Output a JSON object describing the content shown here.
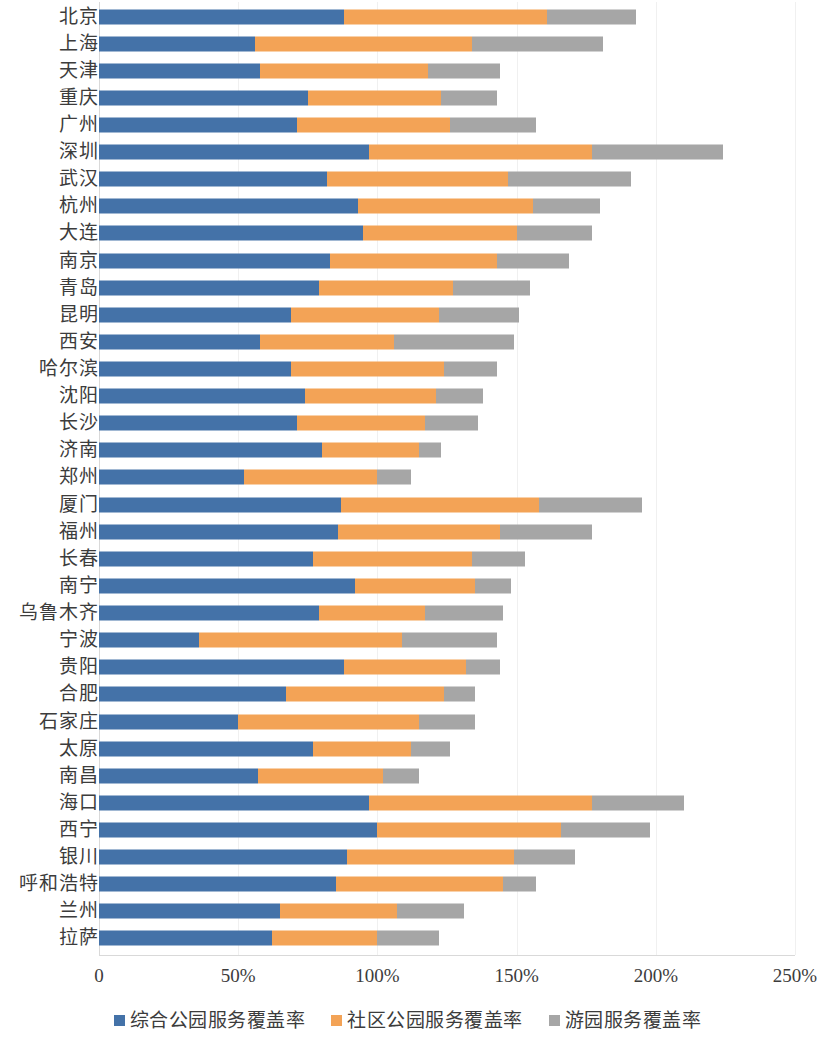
{
  "chart_data": {
    "type": "bar",
    "orientation": "horizontal",
    "stacked": true,
    "title": "",
    "subtitle": "",
    "xlabel": "",
    "ylabel": "",
    "xlim": [
      0,
      250
    ],
    "xtick_labels": [
      "0",
      "50%",
      "100%",
      "150%",
      "200%",
      "250%"
    ],
    "xtick_values": [
      0,
      50,
      100,
      150,
      200,
      250
    ],
    "grid": true,
    "legend_position": "bottom",
    "unit": "%",
    "colors": {
      "series_1": "#4472a8",
      "series_2": "#f3a356",
      "series_3": "#a6a6a6",
      "gridline": "#f0f0f0",
      "axis": "#d9d9d9",
      "text": "#3c3c3c"
    },
    "categories": [
      "北京",
      "上海",
      "天津",
      "重庆",
      "广州",
      "深圳",
      "武汉",
      "杭州",
      "大连",
      "南京",
      "青岛",
      "昆明",
      "西安",
      "哈尔滨",
      "沈阳",
      "长沙",
      "济南",
      "郑州",
      "厦门",
      "福州",
      "长春",
      "南宁",
      "乌鲁木齐",
      "宁波",
      "贵阳",
      "合肥",
      "石家庄",
      "太原",
      "南昌",
      "海口",
      "西宁",
      "银川",
      "呼和浩特",
      "兰州",
      "拉萨"
    ],
    "series": [
      {
        "name": "综合公园服务覆盖率",
        "color": "#4472a8",
        "values": [
          88,
          56,
          58,
          75,
          71,
          97,
          82,
          93,
          95,
          83,
          79,
          69,
          58,
          69,
          74,
          71,
          80,
          52,
          87,
          86,
          77,
          92,
          79,
          36,
          88,
          67,
          50,
          77,
          57,
          97,
          100,
          89,
          85,
          65,
          62
        ]
      },
      {
        "name": "社区公园服务覆盖率",
        "color": "#f3a356",
        "values": [
          73,
          78,
          60,
          48,
          55,
          80,
          65,
          63,
          55,
          60,
          48,
          53,
          48,
          55,
          47,
          46,
          35,
          48,
          71,
          58,
          57,
          43,
          38,
          73,
          44,
          57,
          65,
          35,
          45,
          80,
          66,
          60,
          60,
          42,
          38
        ]
      },
      {
        "name": "游园服务覆盖率",
        "color": "#a6a6a6",
        "values": [
          32,
          47,
          26,
          20,
          31,
          47,
          44,
          24,
          27,
          26,
          28,
          29,
          43,
          19,
          17,
          19,
          8,
          12,
          37,
          33,
          19,
          13,
          28,
          34,
          12,
          11,
          20,
          14,
          13,
          33,
          32,
          22,
          12,
          24,
          22
        ]
      }
    ],
    "totals": [
      193,
      181,
      144,
      143,
      157,
      224,
      191,
      180,
      177,
      169,
      155,
      151,
      149,
      143,
      138,
      136,
      123,
      112,
      195,
      177,
      153,
      148,
      145,
      143,
      144,
      135,
      135,
      126,
      115,
      210,
      198,
      171,
      157,
      131,
      122
    ]
  },
  "axis": {
    "ticks": [
      {
        "label": "0",
        "value": 0
      },
      {
        "label": "50%",
        "value": 50
      },
      {
        "label": "100%",
        "value": 100
      },
      {
        "label": "150%",
        "value": 150
      },
      {
        "label": "200%",
        "value": 200
      },
      {
        "label": "250%",
        "value": 250
      }
    ]
  },
  "legend": {
    "items": [
      {
        "label": "综合公园服务覆盖率",
        "color": "#4472a8"
      },
      {
        "label": "社区公园服务覆盖率",
        "color": "#f3a356"
      },
      {
        "label": "游园服务覆盖率",
        "color": "#a6a6a6"
      }
    ]
  }
}
